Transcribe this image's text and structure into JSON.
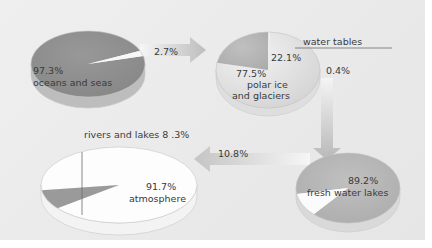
{
  "chart_data": {
    "type": "pie",
    "title": "",
    "charts": [
      {
        "id": "oceans",
        "slices": [
          {
            "label": "oceans and seas",
            "value": 97.3
          },
          {
            "label": "outflow to polar ice and glaciers",
            "value": 2.7
          }
        ]
      },
      {
        "id": "polar_ice",
        "slices": [
          {
            "label": "polar ice and glaciers",
            "value": 77.5
          },
          {
            "label": "water tables",
            "value": 22.1
          },
          {
            "label": "outflow to fresh water lakes",
            "value": 0.4
          }
        ]
      },
      {
        "id": "fresh_water",
        "slices": [
          {
            "label": "fresh water lakes",
            "value": 89.2
          },
          {
            "label": "outflow to atmosphere",
            "value": 10.8
          }
        ]
      },
      {
        "id": "atmosphere",
        "slices": [
          {
            "label": "atmosphere",
            "value": 91.7
          },
          {
            "label": "rivers and lakes",
            "value": 8.3
          }
        ]
      }
    ],
    "flows": [
      {
        "from": "oceans",
        "to": "polar_ice",
        "value": 2.7
      },
      {
        "from": "polar_ice",
        "to": "fresh_water",
        "value": 0.4
      },
      {
        "from": "fresh_water",
        "to": "atmosphere",
        "value": 10.8
      }
    ]
  },
  "labels": {
    "oceans_pct": "97.3%",
    "oceans_name": "oceans  and seas",
    "flow1": "2.7%",
    "polar_pct": "77.5%",
    "polar_name_1": "polar ice",
    "polar_name_2": "and glaciers",
    "water_tables_pct": "22.1%",
    "water_tables_name": "water tables",
    "flow2": "0.4%",
    "fresh_pct": "89.2%",
    "fresh_name": "fresh water lakes",
    "flow3": "10.8%",
    "atmo_pct": "91.7%",
    "atmo_name": "atmosphere",
    "rivers": "rivers and lakes  8 .3%"
  },
  "colors": {
    "background": "#ebebeb",
    "dark_slice": "#8e8e8e",
    "mid_slice": "#b4b4b4",
    "light_slice": "#d6d6d6",
    "white_slice": "#fbfbfb",
    "arrow": "#c8c8c8",
    "text": "#3a3a3a"
  }
}
